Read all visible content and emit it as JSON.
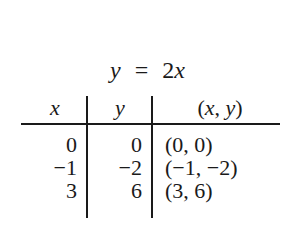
{
  "title": {
    "lhs": "y",
    "eq": "=",
    "rhs": "2x"
  },
  "table": {
    "headers": [
      "x",
      "y",
      "(x, y)"
    ],
    "rows": [
      {
        "x": "0",
        "y": "0",
        "pair": "(0, 0)"
      },
      {
        "x": "−1",
        "y": "−2",
        "pair": "(−1, −2)"
      },
      {
        "x": "3",
        "y": "6",
        "pair": "(3, 6)"
      }
    ]
  }
}
